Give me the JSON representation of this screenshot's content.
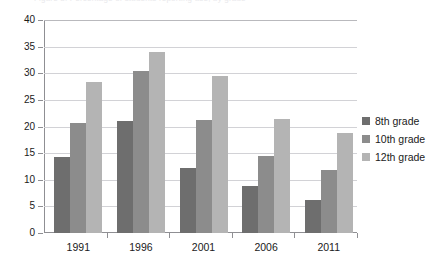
{
  "cut_title": "Figure 3. Percentage of students reporting use, by grade",
  "chart_data": {
    "type": "bar",
    "title": "",
    "xlabel": "",
    "ylabel": "",
    "categories": [
      "1991",
      "1996",
      "2001",
      "2006",
      "2011"
    ],
    "series": [
      {
        "name": "8th grade",
        "color": "#6e6e6e",
        "values": [
          14.2,
          21.0,
          12.3,
          8.8,
          6.2
        ]
      },
      {
        "name": "10th grade",
        "color": "#8c8c8c",
        "values": [
          20.7,
          30.5,
          21.3,
          14.4,
          11.9
        ]
      },
      {
        "name": "12th grade",
        "color": "#b4b4b4",
        "values": [
          28.3,
          34.0,
          29.5,
          21.5,
          18.7
        ]
      }
    ],
    "ylim": [
      0,
      40
    ],
    "yticks": [
      0,
      5,
      10,
      15,
      20,
      25,
      30,
      35,
      40
    ],
    "ytick_labels": [
      "0",
      "5",
      "10",
      "15",
      "20",
      "25",
      "30",
      "35",
      "40"
    ],
    "grid": true,
    "legend_position": "right"
  }
}
